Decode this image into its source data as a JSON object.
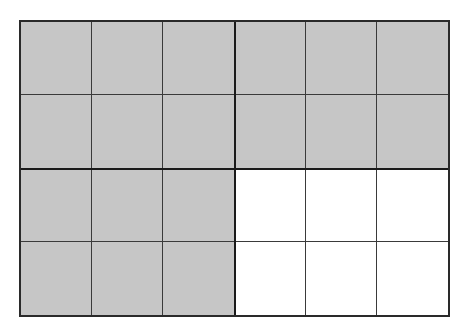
{
  "diagram": {
    "type": "area-model-grid",
    "blocks_layout": {
      "rows": 2,
      "cols": 2
    },
    "cells_per_block": {
      "rows": 2,
      "cols": 3
    },
    "total_cells": 24,
    "shaded_cells": 18,
    "colors": {
      "shaded": "#c6c6c6",
      "unshaded": "#ffffff",
      "line": "#1a1a1a"
    },
    "blocks": [
      {
        "position": "top-left",
        "shaded": true
      },
      {
        "position": "top-right",
        "shaded": true
      },
      {
        "position": "bottom-left",
        "shaded": true
      },
      {
        "position": "bottom-right",
        "shaded": false
      }
    ]
  }
}
